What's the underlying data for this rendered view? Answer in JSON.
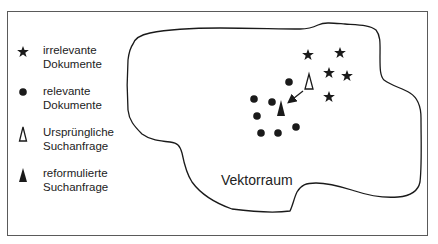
{
  "legend": {
    "items": [
      {
        "symbol": "star-icon",
        "line1": "irrelevante",
        "line2": "Dokumente"
      },
      {
        "symbol": "dot-icon",
        "line1": "relevante",
        "line2": "Dokumente"
      },
      {
        "symbol": "open-triangle-icon",
        "line1": "Ursprüngliche",
        "line2": "Suchanfrage"
      },
      {
        "symbol": "filled-triangle-icon",
        "line1": "reformulierte",
        "line2": "Suchanfrage"
      }
    ]
  },
  "region_label": "Vektorraum",
  "points": {
    "irrelevant_documents": [
      [
        308,
        55
      ],
      [
        340,
        53
      ],
      [
        329,
        73
      ],
      [
        347,
        76
      ],
      [
        329,
        97
      ]
    ],
    "relevant_documents": [
      [
        289,
        82
      ],
      [
        254,
        99
      ],
      [
        272,
        102
      ],
      [
        257,
        116
      ],
      [
        296,
        127
      ],
      [
        261,
        133
      ],
      [
        278,
        133
      ]
    ],
    "original_query": [
      309,
      82
    ],
    "reformulated_query": [
      281,
      109
    ]
  },
  "colors": {
    "ink": "#1a1a1a",
    "frame": "#5a5a5a",
    "background": "#ffffff"
  }
}
